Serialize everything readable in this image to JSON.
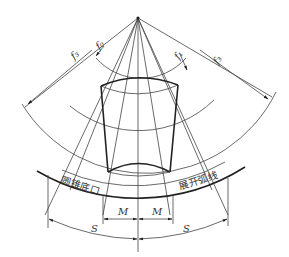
{
  "diagram": {
    "labels": {
      "f3_left": "f₃",
      "f0_left": "f₀",
      "f1_right": "f₁",
      "f3_right": "f₃",
      "cone_bottom": "圆锥底口",
      "development_arc": "展开弧线",
      "m_left": "M",
      "m_right": "M",
      "s_left": "S",
      "s_right": "S"
    },
    "colors": {
      "line": "#333333",
      "background": "#ffffff"
    }
  }
}
